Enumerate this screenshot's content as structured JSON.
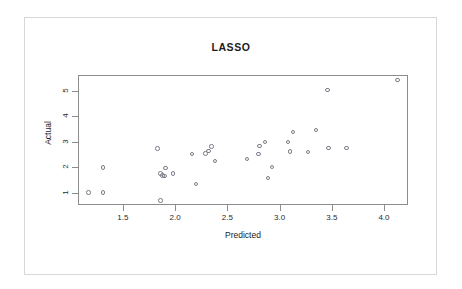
{
  "chart_data": {
    "type": "scatter",
    "title": "LASSO",
    "xlabel": "Predicted",
    "ylabel": "Actual",
    "xlim": [
      1.07,
      4.23
    ],
    "ylim": [
      0.52,
      5.62
    ],
    "xticks": [
      1.5,
      2.0,
      2.5,
      3.0,
      3.5,
      4.0
    ],
    "xtick_labels": [
      "1.5",
      "2.0",
      "2.5",
      "3.0",
      "3.5",
      "4.0"
    ],
    "yticks": [
      1,
      2,
      3,
      4,
      5
    ],
    "ytick_labels": [
      "1",
      "2",
      "3",
      "4",
      "5"
    ],
    "grid": false,
    "legend": false,
    "marker": "open-circle",
    "marker_color": "#7d7d8a",
    "points": [
      {
        "x": 1.16,
        "y": 1.05
      },
      {
        "x": 1.3,
        "y": 1.05
      },
      {
        "x": 1.3,
        "y": 2.03
      },
      {
        "x": 1.82,
        "y": 2.78
      },
      {
        "x": 1.85,
        "y": 1.8
      },
      {
        "x": 1.85,
        "y": 0.73
      },
      {
        "x": 1.87,
        "y": 1.72
      },
      {
        "x": 1.89,
        "y": 1.7
      },
      {
        "x": 1.9,
        "y": 2.0
      },
      {
        "x": 1.97,
        "y": 1.8
      },
      {
        "x": 2.15,
        "y": 2.56
      },
      {
        "x": 2.19,
        "y": 1.38
      },
      {
        "x": 2.28,
        "y": 2.58
      },
      {
        "x": 2.31,
        "y": 2.67
      },
      {
        "x": 2.34,
        "y": 2.86
      },
      {
        "x": 2.37,
        "y": 2.28
      },
      {
        "x": 2.68,
        "y": 2.36
      },
      {
        "x": 2.79,
        "y": 2.55
      },
      {
        "x": 2.8,
        "y": 2.88
      },
      {
        "x": 2.85,
        "y": 3.02
      },
      {
        "x": 2.88,
        "y": 1.62
      },
      {
        "x": 2.92,
        "y": 2.05
      },
      {
        "x": 3.07,
        "y": 3.03
      },
      {
        "x": 3.09,
        "y": 2.66
      },
      {
        "x": 3.12,
        "y": 3.42
      },
      {
        "x": 3.26,
        "y": 2.64
      },
      {
        "x": 3.34,
        "y": 3.51
      },
      {
        "x": 3.45,
        "y": 5.06
      },
      {
        "x": 3.46,
        "y": 2.8
      },
      {
        "x": 3.63,
        "y": 2.8
      },
      {
        "x": 4.12,
        "y": 5.47
      }
    ]
  }
}
